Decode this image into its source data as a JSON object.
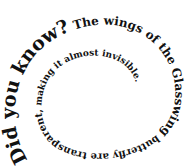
{
  "spiral": {
    "full_text": "Did you know? The wings of the Glasswing butterfly are transparent, making it almost invisible.",
    "segments": [
      {
        "text": "Did you know?",
        "size": 19
      },
      {
        "text": " The wings of the Glasswing",
        "size": 12
      },
      {
        "text": " butterfly are transparent,",
        "size": 10
      },
      {
        "text": " making it almost invisible.",
        "size": 9
      }
    ],
    "text_color": "#111111",
    "background": "#ffffff"
  }
}
